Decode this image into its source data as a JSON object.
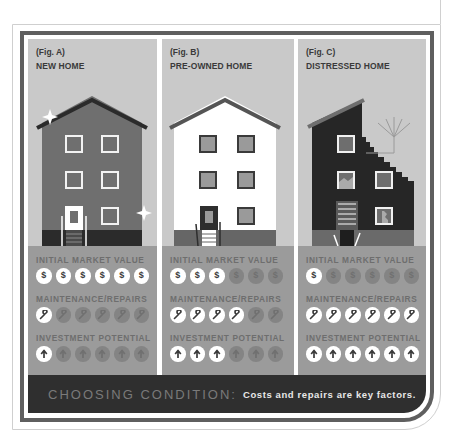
{
  "figures": [
    {
      "id": "A",
      "label": "(Fig. A)",
      "title": "NEW HOME",
      "metrics": {
        "initial_market_value": {
          "label": "INITIAL MARKET VALUE",
          "active": 6,
          "total": 6,
          "icon": "dollar-icon",
          "glyph": "$"
        },
        "maintenance_repairs": {
          "label": "MAINTENANCE/REPAIRS",
          "active": 1,
          "total": 6,
          "icon": "wrench-icon"
        },
        "investment_potential": {
          "label": "INVESTMENT POTENTIAL",
          "active": 1,
          "total": 6,
          "icon": "up-arrow-icon"
        }
      }
    },
    {
      "id": "B",
      "label": "(Fig. B)",
      "title": "PRE-OWNED HOME",
      "metrics": {
        "initial_market_value": {
          "label": "INITIAL MARKET VALUE",
          "active": 3,
          "total": 6,
          "icon": "dollar-icon",
          "glyph": "$"
        },
        "maintenance_repairs": {
          "label": "MAINTENANCE/REPAIRS",
          "active": 4,
          "total": 6,
          "icon": "wrench-icon"
        },
        "investment_potential": {
          "label": "INVESTMENT POTENTIAL",
          "active": 3,
          "total": 6,
          "icon": "up-arrow-icon"
        }
      }
    },
    {
      "id": "C",
      "label": "(Fig. C)",
      "title": "DISTRESSED HOME",
      "metrics": {
        "initial_market_value": {
          "label": "INITIAL MARKET VALUE",
          "active": 1,
          "total": 6,
          "icon": "dollar-icon",
          "glyph": "$"
        },
        "maintenance_repairs": {
          "label": "MAINTENANCE/REPAIRS",
          "active": 6,
          "total": 6,
          "icon": "wrench-icon"
        },
        "investment_potential": {
          "label": "INVESTMENT POTENTIAL",
          "active": 6,
          "total": 6,
          "icon": "up-arrow-icon"
        }
      }
    }
  ],
  "banner": {
    "title": "CHOOSING CONDITION:",
    "subtitle": "Costs and repairs are key factors."
  },
  "colors": {
    "frame": "#5f5f5f",
    "sky": "#c9c9c9",
    "metrics_bg": "#9b9b9b",
    "banner_bg": "#2f2f2f",
    "new_home_wall": "#6f6f6f",
    "preowned_wall": "#ffffff",
    "distressed_wall": "#262626"
  }
}
